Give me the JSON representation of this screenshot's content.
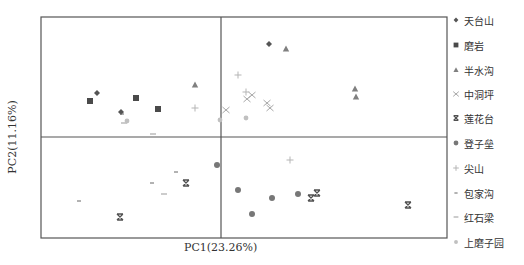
{
  "chart_data": {
    "type": "scatter",
    "title": "",
    "xlabel": "PC1(23.26%)",
    "ylabel": "PC2(11.16%)",
    "grid": false,
    "legend_position": "right",
    "axes_lines_at_origin": true,
    "plot_frame_px": {
      "left": 41,
      "top": 17,
      "right": 447,
      "bottom": 238
    },
    "origin_px": {
      "x": 221,
      "y": 137
    },
    "series": [
      {
        "name": "天台山",
        "marker": "diamond",
        "color": "#555555",
        "points_px": [
          [
            97,
            93
          ],
          [
            121,
            112
          ],
          [
            269,
            44
          ]
        ]
      },
      {
        "name": "磨岩",
        "marker": "square",
        "color": "#4a4a4a",
        "points_px": [
          [
            90,
            101
          ],
          [
            136,
            98
          ],
          [
            158,
            109
          ]
        ]
      },
      {
        "name": "半水沟",
        "marker": "triangle",
        "color": "#808080",
        "points_px": [
          [
            195,
            85
          ],
          [
            286,
            49
          ],
          [
            355,
            89
          ],
          [
            356,
            97
          ]
        ]
      },
      {
        "name": "中洞坪",
        "marker": "x",
        "color": "#a8a8a8",
        "points_px": [
          [
            226,
            110
          ],
          [
            247,
            99
          ],
          [
            252,
            95
          ],
          [
            267,
            103
          ],
          [
            270,
            108
          ]
        ]
      },
      {
        "name": "莲花台",
        "marker": "bowtie",
        "color": "#505050",
        "points_px": [
          [
            120,
            217
          ],
          [
            186,
            183
          ],
          [
            311,
            198
          ],
          [
            317,
            193
          ],
          [
            408,
            205
          ]
        ]
      },
      {
        "name": "登子垒",
        "marker": "circle",
        "color": "#777777",
        "points_px": [
          [
            217,
            165
          ],
          [
            238,
            190
          ],
          [
            252,
            214
          ],
          [
            272,
            198
          ],
          [
            298,
            194
          ]
        ]
      },
      {
        "name": "尖山",
        "marker": "plus",
        "color": "#b5b5b5",
        "points_px": [
          [
            195,
            108
          ],
          [
            238,
            75
          ],
          [
            246,
            92
          ],
          [
            290,
            160
          ]
        ]
      },
      {
        "name": "包家沟",
        "marker": "dash-short",
        "color": "#666666",
        "points_px": [
          [
            79,
            201
          ],
          [
            152,
            183
          ],
          [
            176,
            172
          ],
          [
            122,
            114
          ]
        ]
      },
      {
        "name": "红石梁",
        "marker": "dash",
        "color": "#999999",
        "points_px": [
          [
            153,
            134
          ],
          [
            164,
            194
          ],
          [
            124,
            123
          ]
        ]
      },
      {
        "name": "上磨子园",
        "marker": "circle-small",
        "color": "#c0c0c0",
        "points_px": [
          [
            127,
            121
          ],
          [
            220,
            120
          ],
          [
            246,
            118
          ]
        ]
      }
    ]
  },
  "legend": {
    "items": [
      "天台山",
      "磨岩",
      "半水沟",
      "中洞坪",
      "莲花台",
      "登子垒",
      "尖山",
      "包家沟",
      "红石梁",
      "上磨子园"
    ]
  },
  "axes": {
    "x_label": "PC1(23.26%)",
    "y_label": "PC2(11.16%)"
  }
}
